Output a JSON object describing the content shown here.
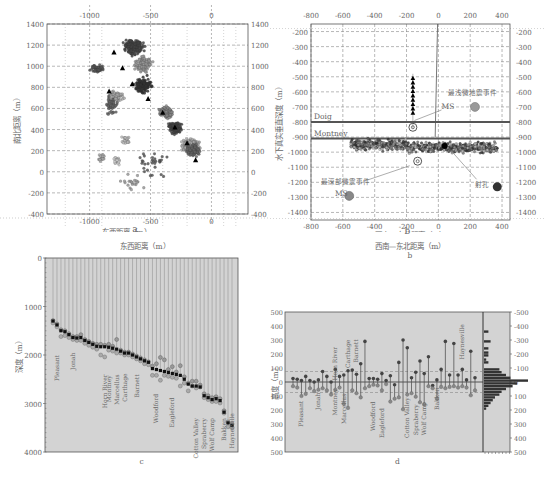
{
  "panels": {
    "a": {
      "label": "a"
    },
    "b": {
      "label": "b"
    },
    "c": {
      "label": "c"
    },
    "d": {
      "label": "d"
    }
  },
  "chart_data": [
    {
      "id": "a",
      "type": "scatter",
      "title": "",
      "xlabel": "东西距离（m）",
      "ylabel": "南北距离（m）",
      "xlim": [
        -1350,
        300
      ],
      "ylim": [
        -400,
        1400
      ],
      "xticks": [
        -1000,
        -500,
        0
      ],
      "yticks": [
        -400,
        -200,
        0,
        200,
        400,
        600,
        800,
        1000,
        1200,
        1400
      ],
      "grid": true,
      "description": "Microseismic event map view, clustered along NW-SE trend; black triangles mark stage positions",
      "stage_markers": [
        {
          "x": -800,
          "y": 1130
        },
        {
          "x": -730,
          "y": 980
        },
        {
          "x": -840,
          "y": 760
        },
        {
          "x": -650,
          "y": 830
        },
        {
          "x": -520,
          "y": 690
        },
        {
          "x": -400,
          "y": 560
        },
        {
          "x": -300,
          "y": 420
        },
        {
          "x": -200,
          "y": 270
        },
        {
          "x": -130,
          "y": 110
        }
      ]
    },
    {
      "id": "b",
      "type": "scatter",
      "title": "",
      "xlabel": "西南—东北距离（m）",
      "ylabel": "水下真实垂直深度（m）",
      "xlim": [
        -800,
        450
      ],
      "ylim": [
        -1450,
        -150
      ],
      "xticks": [
        -800,
        -600,
        -400,
        -200,
        0,
        200,
        400
      ],
      "yticks": [
        -200,
        -300,
        -400,
        -500,
        -600,
        -700,
        -800,
        -900,
        -1000,
        -1100,
        -1200,
        -1300,
        -1400
      ],
      "grid": true,
      "formations": [
        {
          "name": "Doig",
          "top_depth": -800
        },
        {
          "name": "Montney",
          "top_depth": -910
        }
      ],
      "annotations": [
        {
          "text": "最浅微地震事件",
          "x": 200,
          "y": -620
        },
        {
          "text": "MS",
          "x": 100,
          "y": -700
        },
        {
          "text": "最深部微震事件",
          "x": -520,
          "y": -1200
        },
        {
          "text": "MS",
          "x": -610,
          "y": -1280
        },
        {
          "text": "射孔",
          "x": 250,
          "y": -1200
        }
      ],
      "ms_circles": [
        {
          "x": 230,
          "y": -700
        },
        {
          "x": -560,
          "y": -1290
        },
        {
          "x": 370,
          "y": -1230
        }
      ],
      "receiver_array": {
        "x": -160,
        "y_from": -510,
        "y_to": -740,
        "count": 9
      }
    },
    {
      "id": "c",
      "type": "scatter",
      "title": "",
      "xlabel": "",
      "ylabel": "深度（m）",
      "ylim": [
        0,
        4000
      ],
      "yticks": [
        0,
        1000,
        2000,
        3000,
        4000
      ],
      "grid": false,
      "well_labels": [
        "Pleasant",
        "Jonah",
        "Horn River",
        "Montney",
        "Marcellus",
        "Carthage",
        "Barnett",
        "Woodford",
        "Eagleford",
        "Cotton Valley",
        "Spraberry",
        "Wolf Camp",
        "Bakken",
        "Haynesville"
      ],
      "perforation_depths": [
        1300,
        1380,
        1500,
        1520,
        1580,
        1640,
        1650,
        1640,
        1700,
        1740,
        1780,
        1820,
        1830,
        1830,
        1840,
        1860,
        1880,
        1920,
        1960,
        1960,
        2000,
        2040,
        2080,
        2120,
        2150,
        2280,
        2300,
        2320,
        2340,
        2360,
        2380,
        2400,
        2420,
        2500,
        2600,
        2640,
        2640,
        2660,
        2840,
        2880,
        2920,
        2900,
        2940,
        3180,
        3400,
        3450
      ],
      "series": [
        {
          "name": "shallowest_event",
          "values": [
            1290,
            1360,
            1480,
            1500,
            1560,
            1620,
            1620,
            1580,
            1680,
            1720,
            1760,
            1780,
            1780,
            1800,
            1780,
            1820,
            1680,
            1900,
            1940,
            1940,
            1980,
            2020,
            2060,
            2100,
            2140,
            2230,
            2180,
            2050,
            2100,
            2300,
            2240,
            2350,
            2220,
            2450,
            2580,
            2540,
            2540,
            2620,
            2800,
            2840,
            2880,
            2860,
            2900,
            3150,
            3380,
            3420
          ]
        },
        {
          "name": "perforation",
          "values": [
            1300,
            1380,
            1500,
            1520,
            1580,
            1640,
            1650,
            1640,
            1700,
            1740,
            1780,
            1820,
            1830,
            1830,
            1840,
            1860,
            1880,
            1920,
            1960,
            1960,
            2000,
            2040,
            2080,
            2120,
            2150,
            2280,
            2300,
            2320,
            2340,
            2360,
            2380,
            2400,
            2420,
            2500,
            2600,
            2640,
            2640,
            2660,
            2840,
            2880,
            2920,
            2900,
            2940,
            3180,
            3400,
            3450
          ]
        },
        {
          "name": "deepest_event",
          "values": [
            1340,
            1420,
            1620,
            1600,
            1640,
            1680,
            1700,
            1700,
            1760,
            1800,
            1840,
            1880,
            2000,
            2040,
            1900,
            1920,
            1960,
            1960,
            2000,
            2000,
            2040,
            2080,
            2120,
            2180,
            2200,
            2420,
            2420,
            2520,
            2420,
            2440,
            2460,
            2480,
            2640,
            2580,
            2740,
            2640,
            2680,
            2660,
            2880,
            2920,
            2960,
            2960,
            2990,
            3200,
            3480,
            3500
          ]
        }
      ]
    },
    {
      "id": "d",
      "type": "bar",
      "title": "",
      "xlabel": "",
      "ylabel": "高度（m）",
      "ylim": [
        500,
        -500
      ],
      "yticks": [
        -500,
        -400,
        -300,
        -200,
        -100,
        0,
        100,
        200,
        300,
        400,
        500
      ],
      "grid": false,
      "reference_lines": [
        -75,
        75
      ],
      "well_labels": [
        "Pleasant",
        "Jonah",
        "Horn River",
        "Montney",
        "Marcellus",
        "Carthage",
        "Barnett",
        "Woodford",
        "Eagleford",
        "Cotton Valley",
        "Spraberry",
        "Wolf Camp",
        "Bakken",
        "Haynesville"
      ],
      "series": [
        {
          "name": "upward_height",
          "values": [
            -25,
            -20,
            -10,
            -40,
            -10,
            0,
            -15,
            -75,
            -40,
            0,
            -90,
            -40,
            -50,
            -80,
            -85,
            -55,
            -130,
            -290,
            -25,
            -25,
            -20,
            -60,
            -10,
            -45,
            20,
            -140,
            -300,
            -245,
            -30,
            -70,
            -150,
            -60,
            -180,
            25,
            -15,
            -90,
            -290,
            -50,
            -275,
            -50,
            -90,
            -15,
            -220,
            -30
          ]
        },
        {
          "name": "downward_height",
          "values": [
            30,
            40,
            100,
            85,
            45,
            65,
            55,
            45,
            60,
            90,
            55,
            40,
            155,
            185,
            60,
            80,
            110,
            45,
            30,
            20,
            25,
            60,
            15,
            140,
            120,
            110,
            195,
            90,
            80,
            105,
            145,
            160,
            30,
            45,
            120,
            35,
            45,
            35,
            30,
            40,
            30,
            40,
            95,
            60
          ]
        }
      ],
      "histogram": {
        "bins": [
          -360,
          -290,
          -240,
          -210,
          -190,
          -160,
          -140,
          -90,
          -70,
          -50,
          -30,
          -10,
          10,
          30,
          50,
          70,
          90,
          110,
          130,
          150,
          170,
          190
        ],
        "counts": [
          2,
          3,
          2,
          2,
          2,
          1,
          2,
          7,
          8,
          10,
          12,
          20,
          15,
          13,
          10,
          8,
          7,
          5,
          4,
          3,
          2,
          1
        ]
      }
    }
  ]
}
